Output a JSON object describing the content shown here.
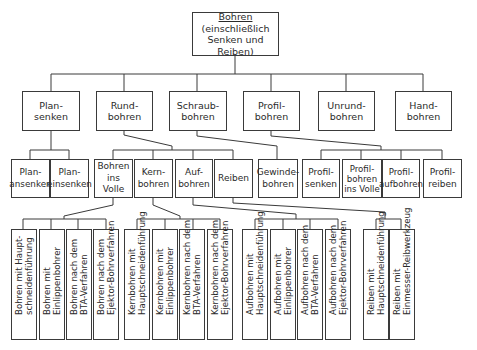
{
  "diagram": {
    "root": {
      "title": "Bohren",
      "subtitle": "(einschließlich\nSenken und Reiben)"
    },
    "level1": [
      {
        "label": "Plan-\nsenken"
      },
      {
        "label": "Rund-\nbohren"
      },
      {
        "label": "Schraub-\nbohren"
      },
      {
        "label": "Profil-\nbohren"
      },
      {
        "label": "Unrund-\nbohren"
      },
      {
        "label": "Hand-\nbohren"
      }
    ],
    "level2": {
      "plansenken": [
        {
          "label": "Plan-\nansenken"
        },
        {
          "label": "Plan-\neinsenken"
        }
      ],
      "rundbohren": [
        {
          "label": "Bohren\nins Volle"
        },
        {
          "label": "Kern-\nbohren"
        },
        {
          "label": "Auf-\nbohren"
        },
        {
          "label": "Reiben"
        }
      ],
      "schraubbohren": [
        {
          "label": "Gewinde-\nbohren"
        }
      ],
      "profilbohren": [
        {
          "label": "Profil-\nsenken"
        },
        {
          "label": "Profil-\nbohren\nins Volle"
        },
        {
          "label": "Profil-\naufbohren"
        },
        {
          "label": "Profil-\nreiben"
        }
      ]
    },
    "level3": {
      "bohren_ins_volle": [
        {
          "label": "Bohren mit Haupt-\nschneidenführung"
        },
        {
          "label": "Bohren mit\nEinlippenbohrer"
        },
        {
          "label": "Bohren nach dem\nBTA-Verfahren"
        },
        {
          "label": "Bohren nach dem\nEjektor-Bohrverfahren"
        }
      ],
      "kernbohren": [
        {
          "label": "Kernbohren mit\nHauptschneidenführung"
        },
        {
          "label": "Kernbohren mit\nEinlippenbohrer"
        },
        {
          "label": "Kernbohren nach dem\nBTA-Verfahren"
        },
        {
          "label": "Kernbohren nach dem\nEjektor-Bohrverfahren"
        }
      ],
      "aufbohren": [
        {
          "label": "Aufbohren mit\nHauptschneidenführung"
        },
        {
          "label": "Aufbohren mit\nEinlippenbohrer"
        },
        {
          "label": "Aufbohren nach dem\nBTA-Verfahren"
        },
        {
          "label": "Aufbohren nach dem\nEjektor-Bohrverfahren"
        }
      ],
      "reiben": [
        {
          "label": "Reiben mit\nHauptschneidenführung"
        },
        {
          "label": "Reiben mit\nEinmesser-Reibwerkzeug"
        }
      ]
    },
    "colors": {
      "line": "#3a3a3a",
      "background": "#ffffff",
      "text": "#2a2a2a"
    }
  }
}
